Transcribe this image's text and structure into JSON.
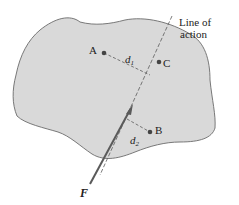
{
  "diagram": {
    "title": "Line of action",
    "labels": {
      "line_of_action_1": "Line of",
      "line_of_action_2": "action",
      "point_a": "A",
      "point_b": "B",
      "point_c": "C",
      "d1_base": "d",
      "d1_sub": "1",
      "d2_base": "d",
      "d2_sub": "2",
      "force": "F"
    },
    "colors": {
      "body_fill": "#d9d9d9",
      "body_stroke": "#6b6b6b",
      "arrow": "#5a5a5a",
      "points": "#444444",
      "text": "#222222"
    }
  }
}
